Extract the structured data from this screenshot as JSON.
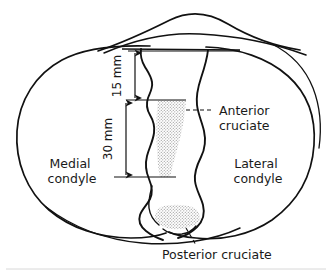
{
  "figure": {
    "type": "anatomical-line-diagram",
    "background_color": "#ffffff",
    "line_color": "#111111",
    "stipple_color": "#b4b4b4"
  },
  "labels": {
    "medial_condyle": {
      "line1": "Medial",
      "line2": "condyle"
    },
    "lateral_condyle": {
      "line1": "Lateral",
      "line2": "condyle"
    },
    "anterior_cruciate": {
      "line1": "Anterior",
      "line2": "cruciate"
    },
    "posterior_cruciate": {
      "line1": "Posterior cruciate"
    }
  },
  "dimensions": [
    {
      "id": "upper",
      "value": "15 mm",
      "orientation": "vertical",
      "description": "Distance from anterior tibial margin to anterior edge of anterior cruciate footprint"
    },
    {
      "id": "lower",
      "value": "30 mm",
      "orientation": "vertical",
      "description": "Anteroposterior length of the anterior cruciate attachment zone"
    }
  ],
  "regions": [
    {
      "id": "anterior-cruciate-footprint",
      "label": "Anterior cruciate",
      "fill": "stipple"
    },
    {
      "id": "posterior-cruciate-footprint",
      "label": "Posterior cruciate",
      "fill": "stipple"
    }
  ]
}
